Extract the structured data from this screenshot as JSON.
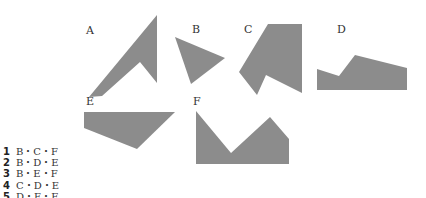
{
  "figure": {
    "fill_color": "#8c8c8c",
    "shapes": [
      {
        "label": "A",
        "points": "89,97 157,15 157,83 140,62 102,96"
      },
      {
        "label": "B",
        "points": "175,37 225,58 191,84"
      },
      {
        "label": "C",
        "points": "268,24 302,24 302,93 266,75 257,95 239,72"
      },
      {
        "label": "D",
        "points": "317,69 339,76 355,55 407,68 407,90 317,90"
      },
      {
        "label": "E",
        "points": "84,112 175,112 137,149 84,128"
      },
      {
        "label": "F",
        "points": "196,111 231,153 270,117 289,139 289,164 196,164"
      }
    ]
  },
  "labels": {
    "A": "A",
    "B": "B",
    "C": "C",
    "D": "D",
    "E": "E",
    "F": "F"
  },
  "choices": [
    {
      "num": "1",
      "text": "B・C・F"
    },
    {
      "num": "2",
      "text": "B・D・E"
    },
    {
      "num": "3",
      "text": "B・E・F"
    },
    {
      "num": "4",
      "text": "C・D・E"
    },
    {
      "num": "5",
      "text": "D・E・F"
    }
  ]
}
